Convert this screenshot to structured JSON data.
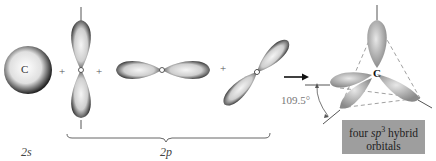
{
  "diagram": {
    "components": [
      {
        "id": "2s",
        "label": "C",
        "shape": "sphere"
      },
      {
        "id": "2pz",
        "shape": "vertical dumbbell"
      },
      {
        "id": "2px",
        "shape": "horizontal dumbbell"
      },
      {
        "id": "2py",
        "shape": "diagonal dumbbell"
      }
    ],
    "operators": [
      "+",
      "+",
      "+"
    ],
    "arrow": "→",
    "labels": {
      "s_label": "2s",
      "p_label": "2p",
      "atom_s": "C",
      "atom_hybrid": "C",
      "angle": "109.5°"
    },
    "result_box": {
      "line1_pre": "four ",
      "line1_em": "sp",
      "line1_sup": "3",
      "line1_post": " hybrid",
      "line2": "orbitals"
    },
    "colors": {
      "lobe_dark": "#1a1a1a",
      "lobe_light": "#f2f2f2",
      "hybrid": "#a8a8a8",
      "box": "#9e9e9e"
    }
  }
}
